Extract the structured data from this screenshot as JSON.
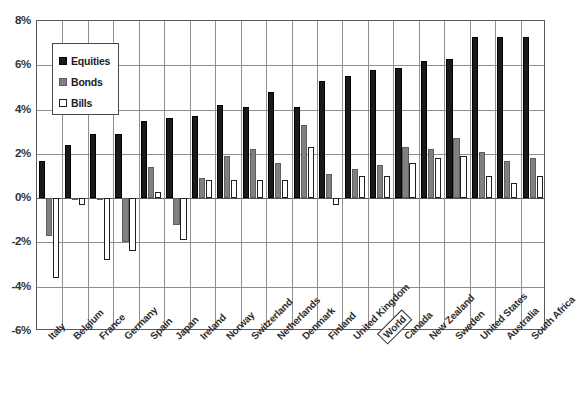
{
  "chart_data": {
    "type": "bar",
    "title": "",
    "subtitle": "",
    "xlabel": "",
    "ylabel": "",
    "ylim": [
      -6,
      8
    ],
    "ytick_labels": [
      "8%",
      "6%",
      "4%",
      "2%",
      "0%",
      "-2%",
      "-4%",
      "-6%"
    ],
    "ytick_values": [
      8,
      6,
      4,
      2,
      0,
      -2,
      -4,
      -6
    ],
    "grid": true,
    "legend_position": "top-left",
    "highlighted_category": "World",
    "categories": [
      "Italy",
      "Belgium",
      "France",
      "Germany",
      "Spain",
      "Japan",
      "Ireland",
      "Norway",
      "Switzerland",
      "Netherlands",
      "Denmark",
      "Finland",
      "United Kingdom",
      "World",
      "Canada",
      "New Zealand",
      "Sweden",
      "United States",
      "Australia",
      "South Africa"
    ],
    "series": [
      {
        "name": "Equities",
        "color": "#1a1a1a",
        "values": [
          1.7,
          2.4,
          2.9,
          2.9,
          3.5,
          3.6,
          3.7,
          4.2,
          4.1,
          4.8,
          4.1,
          5.3,
          5.5,
          5.8,
          5.9,
          6.2,
          6.3,
          7.3,
          7.3,
          7.3
        ]
      },
      {
        "name": "Bonds",
        "color": "#808080",
        "values": [
          -1.7,
          -0.1,
          -0.1,
          -2.0,
          1.4,
          -1.2,
          0.9,
          1.9,
          2.2,
          1.6,
          3.3,
          1.1,
          1.3,
          1.5,
          2.3,
          2.2,
          2.7,
          2.1,
          1.7,
          1.8
        ]
      },
      {
        "name": "Bills",
        "color": "#ffffff",
        "values": [
          -3.6,
          -0.3,
          -2.8,
          -2.4,
          0.3,
          -1.9,
          0.8,
          0.8,
          0.8,
          0.8,
          2.3,
          -0.3,
          1.0,
          1.0,
          1.6,
          1.8,
          1.9,
          1.0,
          0.7,
          1.0
        ]
      }
    ]
  },
  "legend": {
    "items": [
      {
        "label": "Equities",
        "key": "equities"
      },
      {
        "label": "Bonds",
        "key": "bonds"
      },
      {
        "label": "Bills",
        "key": "bills"
      }
    ]
  }
}
